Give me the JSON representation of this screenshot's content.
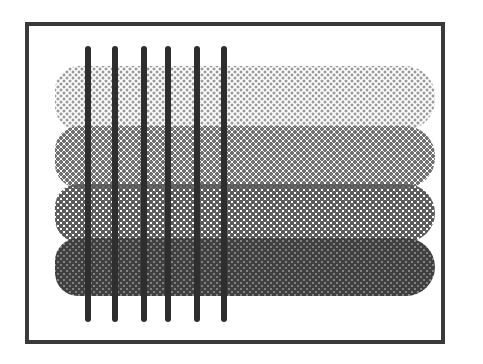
{
  "figure": {
    "frame_color": "#3a3a3a",
    "bar_color": "#2e2e2e",
    "bars": [
      {
        "x": 85
      },
      {
        "x": 112
      },
      {
        "x": 141
      },
      {
        "x": 165
      },
      {
        "x": 194
      },
      {
        "x": 221
      }
    ],
    "bands": [
      {
        "top": 66,
        "height": 64,
        "dot_color": "#9a9a9a",
        "dot_size": 1.2
      },
      {
        "top": 126,
        "height": 62,
        "dot_color": "#6f6f6f",
        "dot_size": 1.6
      },
      {
        "top": 184,
        "height": 58,
        "dot_color": "#5a5a5a",
        "dot_size": 1.9
      },
      {
        "top": 238,
        "height": 58,
        "dot_color": "#404040",
        "dot_size": 2.2
      }
    ]
  }
}
